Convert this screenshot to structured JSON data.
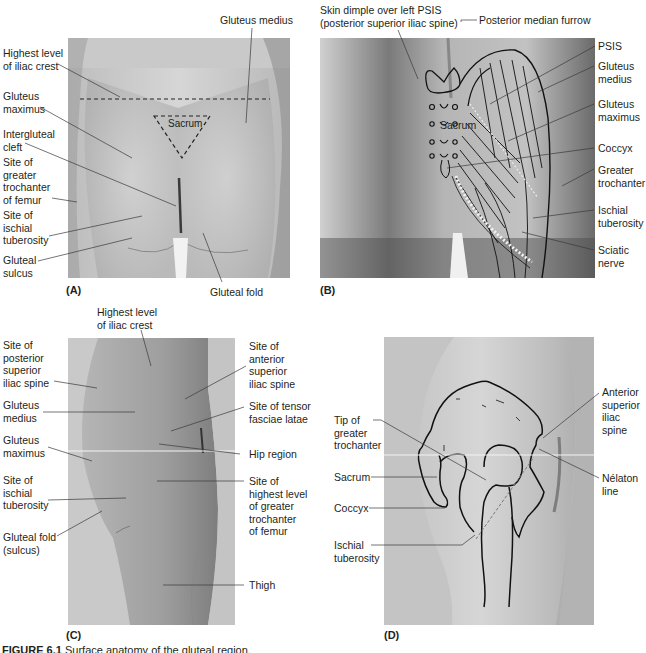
{
  "figure": {
    "caption_label": "FIGURE 6.1",
    "caption_text": "Surface anatomy of the gluteal region."
  },
  "panels": {
    "A": {
      "id": "(A)",
      "labels": {
        "gluteus_medius": "Gluteus medius",
        "highest_iliac_crest": "Highest level\nof iliac crest",
        "gluteus_maximus": "Gluteus\nmaximus",
        "intergluteal_cleft": "Intergluteal\ncleft",
        "greater_trochanter": "Site of\ngreater\ntrochanter\nof femur",
        "ischial_tuberosity": "Site of\nischial\ntuberosity",
        "gluteal_sulcus": "Gluteal\nsulcus",
        "gluteal_fold": "Gluteal fold",
        "sacrum": "Sacrum"
      }
    },
    "B": {
      "id": "(B)",
      "labels": {
        "skin_dimple": "Skin dimple over left PSIS\n(posterior superior iliac spine)",
        "posterior_median_furrow": "Posterior median furrow",
        "psis": "PSIS",
        "gluteus_medius": "Gluteus\nmedius",
        "gluteus_maximus": "Gluteus\nmaximus",
        "coccyx": "Coccyx",
        "greater_trochanter": "Greater\ntrochanter",
        "ischial_tuberosity": "Ischial\ntuberosity",
        "sciatic_nerve": "Sciatic\nnerve",
        "sacrum": "Sacrum"
      }
    },
    "C": {
      "id": "(C)",
      "labels": {
        "highest_iliac_crest": "Highest level\nof iliac crest",
        "posterior_superior_iliac_spine": "Site of\nposterior\nsuperior\niliac spine",
        "gluteus_medius": "Gluteus\nmedius",
        "gluteus_maximus": "Gluteus\nmaximus",
        "ischial_tuberosity": "Site of\nischial\ntuberosity",
        "gluteal_fold": "Gluteal fold\n(sulcus)",
        "anterior_superior_iliac_spine": "Site of\nanterior\nsuperior\niliac spine",
        "tensor_fasciae_latae": "Site of tensor\nfasciae latae",
        "hip_region": "Hip region",
        "greater_trochanter": "Site of\nhighest level\nof greater\ntrochanter\nof femur",
        "thigh": "Thigh"
      }
    },
    "D": {
      "id": "(D)",
      "labels": {
        "tip_greater_trochanter": "Tip of\ngreater\ntrochanter",
        "sacrum": "Sacrum",
        "coccyx": "Coccyx",
        "ischial_tuberosity": "Ischial\ntuberosity",
        "asis": "Anterior\nsuperior\niliac\nspine",
        "nelaton_line": "Nélaton\nline"
      }
    }
  },
  "colors": {
    "text": "#231f20",
    "leader": "#4a4a4a",
    "photo_light": "#d4d4d4",
    "photo_mid": "#a9a9a9",
    "photo_dark": "#5a5a5a"
  }
}
